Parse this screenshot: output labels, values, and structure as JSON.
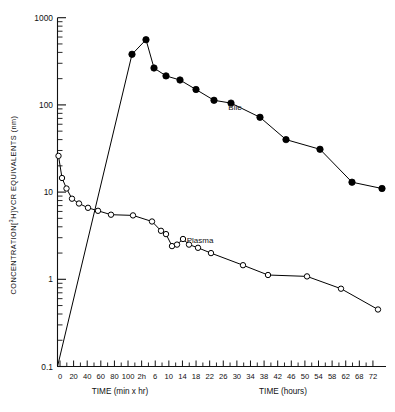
{
  "figure": {
    "yaxis_title": "CONCENTRATION [3H] VCR EQUIVALENTS (nm)",
    "yaxis_title_parts": {
      "pre": "CONCENTRATION[",
      "sup": "3",
      "mid": "H]",
      "post": "VCR EQUIVALENTS (nm)"
    },
    "xaxis_left_title": "TIME (min x hr)",
    "xaxis_right_title": "TIME (hours)"
  },
  "chart_data": {
    "type": "line",
    "title": "",
    "xlabel": "TIME (min x hr) / TIME (hours)",
    "ylabel": "CONCENTRATION [3H] VCR EQUIVALENTS (nm)",
    "yscale": "log",
    "ylim": [
      0.1,
      1000
    ],
    "ytick_labels": [
      "1000",
      "100",
      "10",
      "1",
      "0.1"
    ],
    "ytick_values": [
      1000,
      100,
      10,
      1,
      0.1
    ],
    "grid": false,
    "legend_position": "inline-annotation",
    "x_minutes_ticks": [
      0,
      20,
      40,
      60,
      80,
      100
    ],
    "x_hours_ticks": [
      "2h",
      6,
      10,
      14,
      18,
      22,
      26,
      30,
      34,
      38,
      42,
      46,
      50,
      54,
      58,
      62,
      68,
      72
    ],
    "x_hours_tick_values": [
      2,
      6,
      10,
      14,
      18,
      22,
      26,
      30,
      34,
      38,
      42,
      46,
      50,
      54,
      58,
      62,
      68,
      72
    ],
    "series": [
      {
        "name": "Bile",
        "marker": "filled-circle",
        "color": "#000000",
        "points": [
          {
            "t_label": "0",
            "x_px": 57.5,
            "y": 0.1
          },
          {
            "t_label": "2h",
            "x_px": 132.0,
            "y": 380
          },
          {
            "t_label": "3h",
            "x_px": 146.0,
            "y": 560
          },
          {
            "t_label": "4h",
            "x_px": 154.0,
            "y": 265
          },
          {
            "t_label": "6h",
            "x_px": 166.0,
            "y": 215
          },
          {
            "t_label": "10h",
            "x_px": 180.0,
            "y": 193
          },
          {
            "t_label": "14h",
            "x_px": 196.0,
            "y": 150
          },
          {
            "t_label": "18h",
            "x_px": 214.0,
            "y": 113
          },
          {
            "t_label": "22h",
            "x_px": 231.0,
            "y": 105
          },
          {
            "t_label": "30h",
            "x_px": 260.0,
            "y": 72
          },
          {
            "t_label": "38h",
            "x_px": 286.0,
            "y": 40
          },
          {
            "t_label": "46h",
            "x_px": 320.0,
            "y": 31
          },
          {
            "t_label": "62h",
            "x_px": 352.0,
            "y": 13
          },
          {
            "t_label": "72h",
            "x_px": 382.0,
            "y": 11
          }
        ]
      },
      {
        "name": "Plasma",
        "marker": "open-circle",
        "color": "#000000",
        "points": [
          {
            "t_label": "0 min",
            "x_px": 58.5,
            "y": 26
          },
          {
            "t_label": "10 min",
            "x_px": 62.0,
            "y": 14.5
          },
          {
            "t_label": "20 min",
            "x_px": 66.5,
            "y": 11.0
          },
          {
            "t_label": "40 min",
            "x_px": 72.0,
            "y": 8.4
          },
          {
            "t_label": "60 min",
            "x_px": 79.0,
            "y": 7.4
          },
          {
            "t_label": "80 min",
            "x_px": 88.0,
            "y": 6.6
          },
          {
            "t_label": "100 min",
            "x_px": 98.0,
            "y": 6.1
          },
          {
            "t_label": "2h",
            "x_px": 111.0,
            "y": 5.5
          },
          {
            "t_label": "6h",
            "x_px": 133.0,
            "y": 5.4
          },
          {
            "t_label": "10h",
            "x_px": 152.0,
            "y": 4.6
          },
          {
            "t_label": "12h",
            "x_px": 161.0,
            "y": 3.6
          },
          {
            "t_label": "14h",
            "x_px": 166.0,
            "y": 3.3
          },
          {
            "t_label": "16h",
            "x_px": 172.0,
            "y": 2.4
          },
          {
            "t_label": "18h",
            "x_px": 177.0,
            "y": 2.5
          },
          {
            "t_label": "20h",
            "x_px": 183.0,
            "y": 2.9
          },
          {
            "t_label": "22h",
            "x_px": 189.0,
            "y": 2.5
          },
          {
            "t_label": "26h",
            "x_px": 198.0,
            "y": 2.3
          },
          {
            "t_label": "30h",
            "x_px": 211.0,
            "y": 2.0
          },
          {
            "t_label": "38h",
            "x_px": 243.0,
            "y": 1.45
          },
          {
            "t_label": "46h",
            "x_px": 268.0,
            "y": 1.12
          },
          {
            "t_label": "54h",
            "x_px": 307.0,
            "y": 1.08
          },
          {
            "t_label": "62h",
            "x_px": 341.0,
            "y": 0.78
          },
          {
            "t_label": "72h",
            "x_px": 378.0,
            "y": 0.45
          }
        ]
      }
    ],
    "annotations": [
      {
        "text": "Bile",
        "x_px": 235,
        "y_px": 110
      },
      {
        "text": "Plasma",
        "x_px": 200,
        "y_px": 243
      }
    ]
  }
}
